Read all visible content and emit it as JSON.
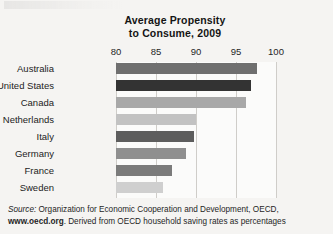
{
  "chart_data": {
    "type": "bar",
    "orientation": "horizontal",
    "title": "Average Propensity to Consume, 2009",
    "title_line1": "Average Propensity",
    "title_line2": "to Consume, 2009",
    "xlabel": "",
    "ylabel": "",
    "xlim": [
      80,
      100
    ],
    "grid": true,
    "legend": "none",
    "ticks": [
      80,
      85,
      90,
      95,
      100
    ],
    "tick_labels": [
      "80",
      "85",
      "90",
      "95",
      "100"
    ],
    "categories": [
      "Australia",
      "United States",
      "Canada",
      "Netherlands",
      "Italy",
      "Germany",
      "France",
      "Sweden"
    ],
    "values": [
      97.6,
      96.9,
      96.3,
      90.0,
      89.7,
      88.8,
      87.0,
      85.9
    ],
    "bar_colors": [
      "#6f6f6f",
      "#333333",
      "#a8a8a8",
      "#c2c2c2",
      "#5d5d5d",
      "#8f8f8f",
      "#7b7b7b",
      "#cfcfcf"
    ],
    "series": [
      {
        "name": "Average Propensity to Consume, 2009",
        "points": [
          {
            "category": "Australia",
            "value": 97.6,
            "color": "#6f6f6f"
          },
          {
            "category": "United States",
            "value": 96.9,
            "color": "#333333"
          },
          {
            "category": "Canada",
            "value": 96.3,
            "color": "#a8a8a8"
          },
          {
            "category": "Netherlands",
            "value": 90.0,
            "color": "#c2c2c2"
          },
          {
            "category": "Italy",
            "value": 89.7,
            "color": "#5d5d5d"
          },
          {
            "category": "Germany",
            "value": 88.8,
            "color": "#8f8f8f"
          },
          {
            "category": "France",
            "value": 87.0,
            "color": "#7b7b7b"
          },
          {
            "category": "Sweden",
            "value": 85.9,
            "color": "#cfcfcf"
          }
        ]
      }
    ]
  },
  "source": {
    "lead": "Source:",
    "body_line1": " Organization for Economic Cooperation and Development, OECD,",
    "url": "www.oecd.org",
    "body_line2": ". Derived from OECD household saving rates as percentages"
  }
}
